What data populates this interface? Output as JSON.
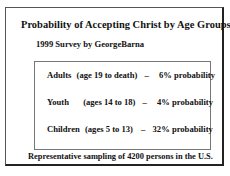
{
  "slide": {
    "title": "Probability of Accepting Christ by Age Groups",
    "subtitle": "1999 Survey by GeorgeBarna",
    "rows": [
      {
        "group": "Adults",
        "range": "(age 19 to death)",
        "dash": "–",
        "probability": "6% probability"
      },
      {
        "group": "Youth",
        "range": "(ages 14 to 18)",
        "dash": "–",
        "probability": "4% probability"
      },
      {
        "group": "Children",
        "range": "(ages 5 to 13)",
        "dash": "–",
        "probability": "32% probability"
      }
    ],
    "footer": "Representative sampling of 4200 persons in the U.S."
  }
}
